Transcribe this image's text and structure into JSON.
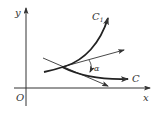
{
  "figure": {
    "type": "curve-intersection-angle",
    "axes": {
      "x_label": "x",
      "y_label": "y",
      "origin_label": "O"
    },
    "curves": [
      {
        "name": "C1",
        "label_main": "C",
        "label_sub": "1"
      },
      {
        "name": "C",
        "label_main": "C",
        "label_sub": ""
      }
    ],
    "angle_label": "α",
    "colors": {
      "ink": "#333333",
      "background": "#ffffff"
    }
  }
}
